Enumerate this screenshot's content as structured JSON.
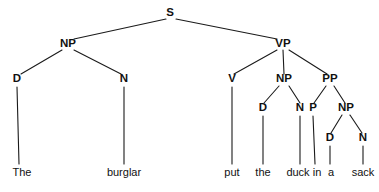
{
  "figure": {
    "kind": "constituency-syntax-tree",
    "sentence": "The burglar put the duck in a sack",
    "background_color": "#ffffff",
    "line_color": "#1a1a1a",
    "text_color": "#111111",
    "width": 379,
    "height": 192
  },
  "nodes": {
    "s": {
      "label": "S",
      "x": 170,
      "y": 16
    },
    "np_subject": {
      "label": "NP",
      "x": 68,
      "y": 47
    },
    "vp": {
      "label": "VP",
      "x": 283,
      "y": 47
    },
    "d_the1": {
      "label": "D",
      "x": 17,
      "y": 82
    },
    "n_burglar": {
      "label": "N",
      "x": 124,
      "y": 82
    },
    "v_put": {
      "label": "V",
      "x": 232,
      "y": 82
    },
    "np_object": {
      "label": "NP",
      "x": 284,
      "y": 82
    },
    "pp": {
      "label": "PP",
      "x": 330,
      "y": 82
    },
    "d_the2": {
      "label": "D",
      "x": 263,
      "y": 111
    },
    "n_duck": {
      "label": "N",
      "x": 300,
      "y": 111
    },
    "p_in": {
      "label": "P",
      "x": 313,
      "y": 111
    },
    "np_sack": {
      "label": "NP",
      "x": 346,
      "y": 111
    },
    "d_a": {
      "label": "D",
      "x": 330,
      "y": 141
    },
    "n_sack": {
      "label": "N",
      "x": 363,
      "y": 141
    }
  },
  "leaves": {
    "the1": {
      "label": "The",
      "x": 22,
      "y": 176
    },
    "burglar": {
      "label": "burglar",
      "x": 124,
      "y": 176
    },
    "put": {
      "label": "put",
      "x": 232,
      "y": 176
    },
    "the2": {
      "label": "the",
      "x": 263,
      "y": 176
    },
    "duck": {
      "label": "duck",
      "x": 298,
      "y": 176
    },
    "in": {
      "label": "in",
      "x": 317,
      "y": 176
    },
    "a": {
      "label": "a",
      "x": 331,
      "y": 176
    },
    "sack": {
      "label": "sack",
      "x": 363,
      "y": 176
    }
  }
}
